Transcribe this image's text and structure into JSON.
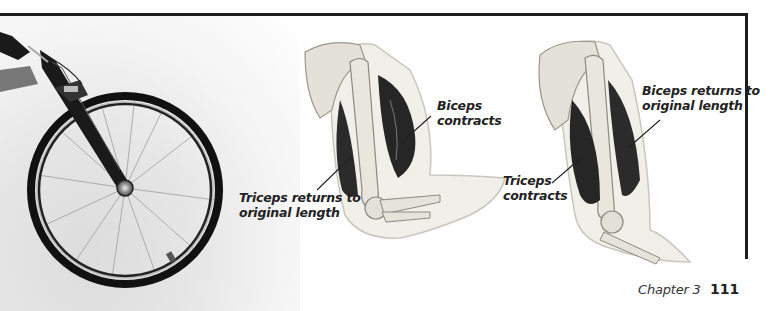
{
  "page": {
    "chapter_label": "Chapter 3",
    "page_number": "111"
  },
  "figures": {
    "bicycle": {
      "description": "Photo of bicycle front wheel and fork"
    },
    "arm_flexed": {
      "labels": {
        "biceps_line1": "Biceps",
        "biceps_line2": "contracts",
        "triceps_line1": "Triceps returns to",
        "triceps_line2": "original length"
      }
    },
    "arm_extended": {
      "labels": {
        "biceps_line1": "Biceps returns to",
        "biceps_line2": "original length",
        "triceps_line1": "Triceps",
        "triceps_line2": "contracts"
      }
    }
  },
  "colors": {
    "frame": "#1e1e1e",
    "muscle": "#2a2a2a",
    "bone": "#e8e6e0",
    "text": "#222222"
  }
}
